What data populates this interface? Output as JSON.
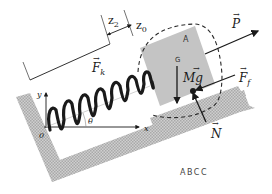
{
  "diagram": {
    "caption": "ABCC",
    "labels": {
      "block": "A",
      "center_of_mass": "G",
      "origin": "0",
      "x_axis": "x",
      "y_axis": "y",
      "angle": "θ",
      "dim_z2": "z",
      "dim_z2_sub": "2",
      "dim_z0": "z",
      "dim_z0_sub": "0"
    },
    "forces": {
      "P": "P",
      "Ff": "F",
      "Ff_sub": "f",
      "N": "N",
      "Mg": "Mg",
      "Mg_prefix": "M",
      "Mg_vec": "g",
      "Fk": "F",
      "Fk_sub": "k"
    },
    "colors": {
      "surface": "#bdbdbd",
      "block": "#c4c4c4",
      "ink": "#1a1a1a",
      "dashed": "#2a2a2a"
    },
    "incline_angle_deg": 22
  }
}
